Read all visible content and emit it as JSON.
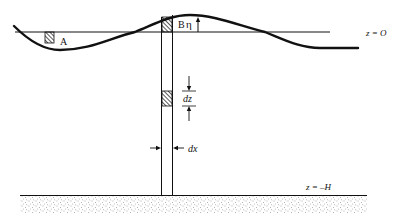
{
  "diagram": {
    "type": "wave-column-schematic",
    "labels": {
      "block_a": "A",
      "block_b": "B",
      "eta": "η",
      "surface": "z = O",
      "dz": "dz",
      "dx": "dx",
      "bottom": "z = –H"
    },
    "colors": {
      "line": "#111111",
      "background": "#ffffff",
      "stipple": "#555555"
    }
  }
}
